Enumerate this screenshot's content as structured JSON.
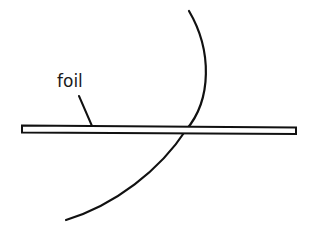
{
  "diagram": {
    "labels": {
      "foil": "foil"
    },
    "colors": {
      "stroke": "#111111",
      "background": "#ffffff",
      "foil_fill": "#ffffff"
    },
    "elements": [
      {
        "type": "foil-strip",
        "description": "thin horizontal rectangle representing a foil"
      },
      {
        "type": "arc",
        "description": "curved trajectory crossing the foil"
      },
      {
        "type": "leader-line",
        "description": "pointer from label to foil"
      }
    ]
  }
}
